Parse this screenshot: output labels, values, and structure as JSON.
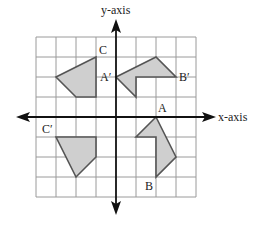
{
  "diagram": {
    "type": "coordinate-grid-reflections",
    "axes": {
      "x_label": "x-axis",
      "y_label": "y-axis"
    },
    "grid": {
      "x_range": [
        -4,
        4
      ],
      "y_range": [
        -4,
        4
      ],
      "unit_px": 20,
      "origin_px": [
        116,
        117
      ]
    },
    "colors": {
      "grid": "#9a9a9a",
      "axis": "#111111",
      "fill": "#cfcfcf",
      "stroke": "#555555"
    },
    "shapes": [
      {
        "name": "original-ABC",
        "points": [
          [
            2,
            0
          ],
          [
            3,
            -2
          ],
          [
            2,
            -3
          ],
          [
            2,
            -1
          ],
          [
            1,
            -1
          ]
        ],
        "labels": [
          {
            "text": "A",
            "at": [
              2,
              0
            ],
            "dx": 2,
            "dy": -5
          },
          {
            "text": "B",
            "at": [
              2,
              -3
            ],
            "dx": -11,
            "dy": 13
          }
        ]
      },
      {
        "name": "reflection-over-x-then-rotated-A-prime-B-prime",
        "points": [
          [
            0,
            2
          ],
          [
            2,
            3
          ],
          [
            3,
            2
          ],
          [
            1,
            2
          ],
          [
            1,
            1
          ]
        ],
        "labels": [
          {
            "text": "A′",
            "at": [
              0,
              2
            ],
            "dx": -16,
            "dy": 4
          },
          {
            "text": "B′",
            "at": [
              3,
              2
            ],
            "dx": 3,
            "dy": 4
          }
        ]
      },
      {
        "name": "quadrant-2-shape-C",
        "points": [
          [
            -1,
            3
          ],
          [
            -3,
            2
          ],
          [
            -2,
            1
          ],
          [
            -1,
            1
          ]
        ],
        "labels": [
          {
            "text": "C",
            "at": [
              -1,
              3
            ],
            "dx": 3,
            "dy": -3
          }
        ]
      },
      {
        "name": "quadrant-3-shape-C-prime",
        "points": [
          [
            -3,
            -1
          ],
          [
            -1,
            -1
          ],
          [
            -1,
            -2
          ],
          [
            -2,
            -3
          ]
        ],
        "labels": [
          {
            "text": "C′",
            "at": [
              -3,
              -1
            ],
            "dx": -14,
            "dy": -4
          }
        ]
      }
    ]
  }
}
